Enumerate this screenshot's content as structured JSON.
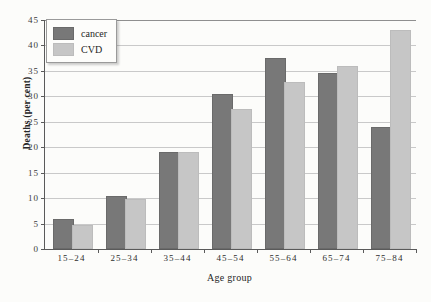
{
  "chart_data": {
    "type": "bar",
    "title": "",
    "xlabel": "Age group",
    "ylabel": "Deaths (per cent)",
    "categories": [
      "15–24",
      "25–34",
      "35–44",
      "45–54",
      "55–64",
      "65–74",
      "75–84"
    ],
    "series": [
      {
        "name": "cancer",
        "color": "#787878",
        "values": [
          5.6,
          10.0,
          18.6,
          30.0,
          37.2,
          34.1,
          23.6
        ]
      },
      {
        "name": "CVD",
        "color": "#c6c6c6",
        "values": [
          4.3,
          9.5,
          18.6,
          27.2,
          32.4,
          35.6,
          42.7
        ]
      }
    ],
    "ylim": [
      0,
      45
    ],
    "yticks": [
      0,
      5,
      10,
      15,
      20,
      25,
      30,
      35,
      40,
      45
    ],
    "ytick_labels": [
      "0",
      "5",
      "10",
      "15",
      "20",
      "25",
      "30",
      "35",
      "40",
      "45"
    ],
    "grid": true,
    "legend_position": "top-left"
  },
  "legend": {
    "entries": [
      {
        "label": "cancer",
        "swatch": "series-cancer"
      },
      {
        "label": "CVD",
        "swatch": "series-cvd"
      }
    ]
  }
}
